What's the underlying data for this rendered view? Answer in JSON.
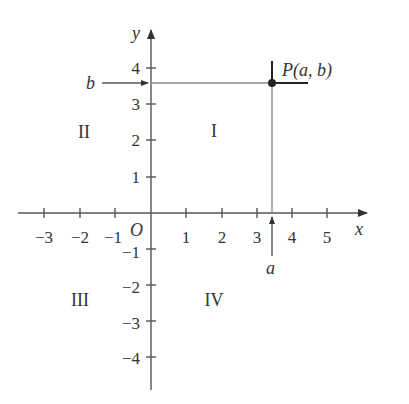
{
  "diagram": {
    "type": "cartesian-plane",
    "axes": {
      "x_label": "x",
      "y_label": "y",
      "origin_label": "O",
      "x_ticks": [
        "−3",
        "−2",
        "−1",
        "1",
        "2",
        "3",
        "4",
        "5"
      ],
      "y_ticks_positive": [
        "1",
        "2",
        "3",
        "4"
      ],
      "y_ticks_negative": [
        "−1",
        "−2",
        "−3",
        "−4"
      ]
    },
    "quadrants": {
      "I": "I",
      "II": "II",
      "III": "III",
      "IV": "IV"
    },
    "point": {
      "label": "P(a, b)",
      "a": 3.5,
      "b": 3.6
    },
    "arrows": {
      "a_label": "a",
      "b_label": "b"
    },
    "colors": {
      "axis": "#555555",
      "guide": "#8a8a8a",
      "point": "#222222",
      "text": "#333333"
    }
  }
}
